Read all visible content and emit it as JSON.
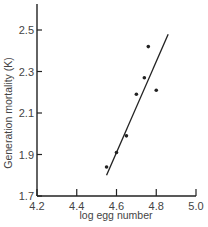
{
  "chart_data": {
    "type": "scatter",
    "title": "",
    "xlabel": "log egg number",
    "ylabel": "Generation mortality (K)",
    "xlim": [
      4.2,
      5.0
    ],
    "ylim": [
      1.7,
      2.6
    ],
    "x_ticks": [
      "4.2",
      "4.4",
      "4.6",
      "4.8",
      "5.0"
    ],
    "y_ticks": [
      "1.7",
      "1.9",
      "2.1",
      "2.3",
      "2.5"
    ],
    "grid": false,
    "legend": null,
    "series": [
      {
        "name": "observations",
        "points": [
          {
            "x": 4.55,
            "y": 1.84
          },
          {
            "x": 4.6,
            "y": 1.91
          },
          {
            "x": 4.65,
            "y": 1.99
          },
          {
            "x": 4.7,
            "y": 2.19
          },
          {
            "x": 4.74,
            "y": 2.27
          },
          {
            "x": 4.76,
            "y": 2.42
          },
          {
            "x": 4.8,
            "y": 2.21
          }
        ]
      }
    ],
    "regression_line": {
      "x1": 4.55,
      "y1": 1.8,
      "x2": 4.86,
      "y2": 2.48
    }
  },
  "colors": {
    "ink": "#222222",
    "text": "#444444",
    "background": "#ffffff"
  }
}
